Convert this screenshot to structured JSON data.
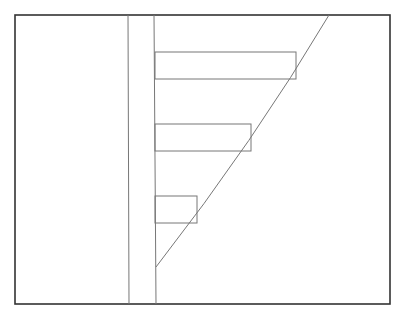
{
  "diagram": {
    "frame": {
      "x1": 15,
      "y1": 15,
      "x2": 390,
      "y2": 304,
      "stroke": "#333333"
    },
    "verticals": [
      {
        "x1": 128,
        "y1": 15,
        "x2": 129,
        "y2": 304
      },
      {
        "x1": 154,
        "y1": 15,
        "x2": 156,
        "y2": 304
      }
    ],
    "bars": [
      {
        "x": 155,
        "y": 52,
        "right": 296,
        "bottom": 79
      },
      {
        "x": 155,
        "y": 124,
        "right": 251,
        "bottom": 151
      },
      {
        "x": 155,
        "y": 196,
        "right": 197,
        "bottom": 223
      }
    ],
    "curve": {
      "start": [
        156,
        267
      ],
      "control": [
        255,
        140
      ],
      "end": [
        329,
        15
      ]
    },
    "line_color": "#777777"
  }
}
